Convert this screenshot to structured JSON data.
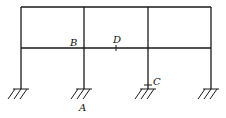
{
  "diagram": {
    "type": "two-story three-bay rigid frame",
    "labels": {
      "A": "A",
      "B": "B",
      "C": "C",
      "D": "D"
    },
    "colors": {
      "line": "#1a1a1a",
      "background": "#ffffff"
    }
  }
}
